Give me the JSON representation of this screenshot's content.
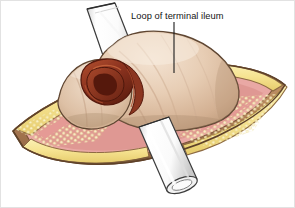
{
  "figure": {
    "kind": "medical-illustration",
    "background_color": "#ffffff",
    "border_color": "#e2e2e2",
    "width": 295,
    "height": 208
  },
  "annotations": [
    {
      "id": "loop-of-terminal-ileum",
      "label": "Loop of terminal ileum",
      "text_color": "#151515",
      "text_x": 130,
      "text_y": 18,
      "leader_color": "#1a1a1a",
      "leader_from_x": 173,
      "leader_from_y": 21,
      "leader_to_x": 173,
      "leader_to_y": 72
    }
  ],
  "structures": {
    "bowel_loop": {
      "name": "Loop of terminal ileum",
      "fill_light": "#f0dcc8",
      "fill_mid": "#ddc0a6",
      "fill_shadow": "#c3a184",
      "outline": "#5f4632"
    },
    "bowel_lumen": {
      "name": "Opened bowel lumen",
      "fill_dark": "#6e2616",
      "fill_mid": "#9c3c22",
      "fill_bright": "#b4512f",
      "outline": "#55190d"
    },
    "subcutaneous_fat": {
      "name": "Subcutaneous fat layer",
      "fill": "#f6e391",
      "globule": "#fbf2c4",
      "globule_shadow": "#dfc25e",
      "outline": "#8d6a43"
    },
    "skin_edge": {
      "name": "Skin and abdominal wall edge",
      "fill": "#d8b48c",
      "fill_dark": "#9c7450",
      "outline": "#6d4e33"
    },
    "peritoneal_tissue": {
      "name": "Peritoneal / muscle tissue",
      "fill": "#e9a8a4",
      "fill_dark": "#cf8079"
    },
    "tube_upper": {
      "name": "Upper drainage tube",
      "fill": "#ffffff",
      "fill_shade": "#e6e6e6",
      "outline": "#3c3c3c"
    },
    "tube_lower": {
      "name": "Lower drainage tube",
      "fill": "#ffffff",
      "fill_shade": "#e0e0e0",
      "lumen_fill": "#f2f2f2",
      "outline": "#3c3c3c"
    }
  }
}
